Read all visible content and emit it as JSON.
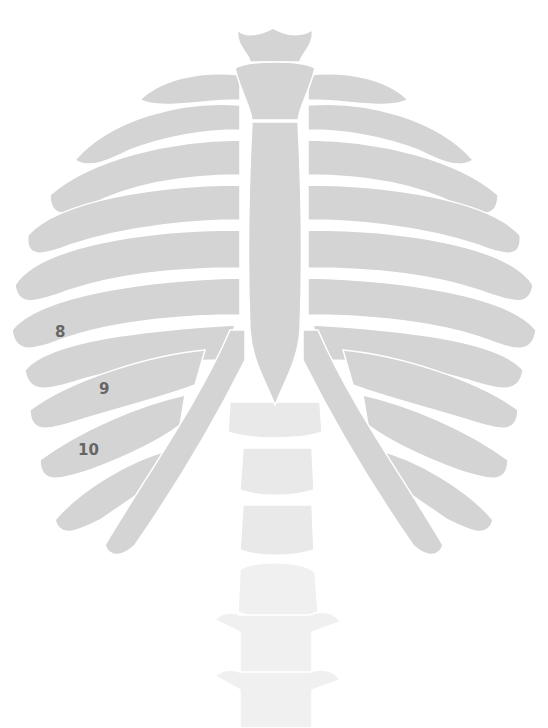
{
  "diagram": {
    "bone_color": "#d4d4d4",
    "vertebra_color": "#ececec",
    "label_color": "#666666",
    "labels": [
      {
        "text": "8",
        "x": 55,
        "y": 323
      },
      {
        "text": "9",
        "x": 99,
        "y": 380
      },
      {
        "text": "10",
        "x": 78,
        "y": 441
      }
    ]
  }
}
